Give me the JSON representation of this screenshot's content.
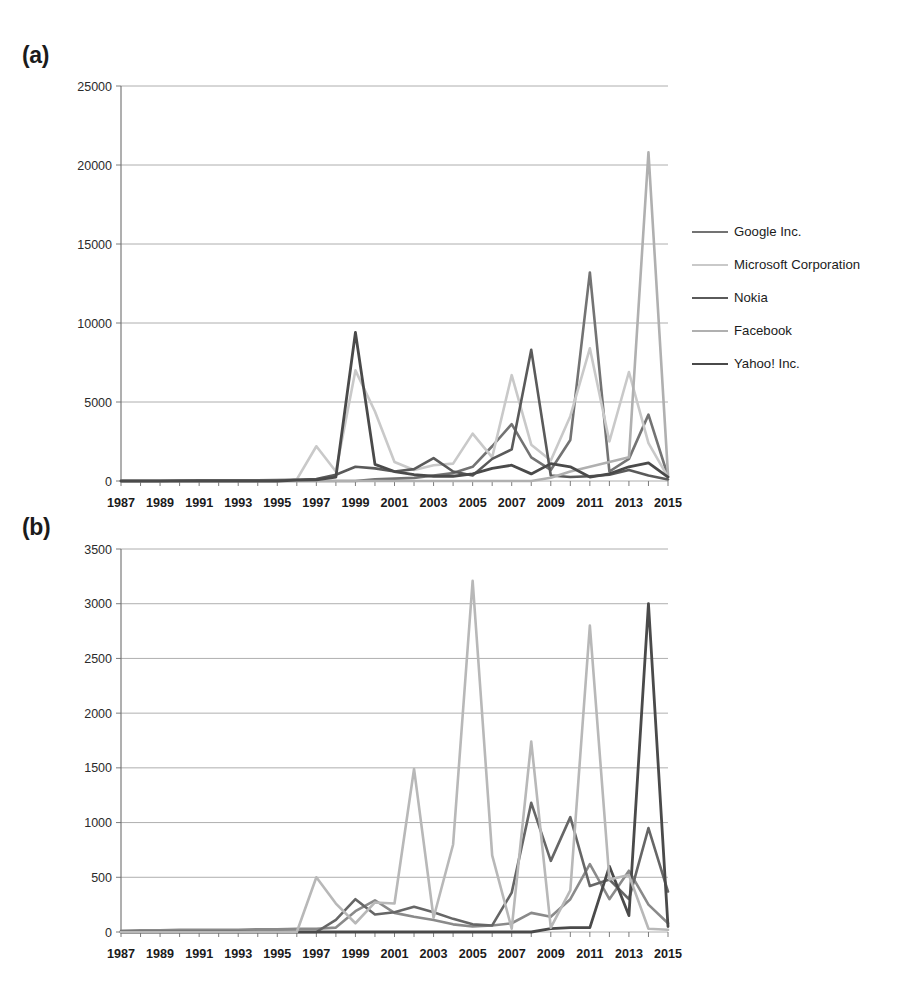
{
  "figure": {
    "panels": [
      {
        "id": "a",
        "label": "(a)"
      },
      {
        "id": "b",
        "label": "(b)"
      }
    ]
  },
  "chart_data": [
    {
      "type": "line",
      "panel_label": "(a)",
      "title": "",
      "xlabel": "",
      "ylabel": "",
      "grid": true,
      "legend_position": "right",
      "xlim": [
        1987,
        2015
      ],
      "ylim": [
        0,
        25000
      ],
      "ytick_values": [
        0,
        5000,
        10000,
        15000,
        20000,
        25000
      ],
      "ytick_labels": [
        "0",
        "5000",
        "10000",
        "15000",
        "20000",
        "25000"
      ],
      "x": [
        1987,
        1988,
        1989,
        1990,
        1991,
        1992,
        1993,
        1994,
        1995,
        1996,
        1997,
        1998,
        1999,
        2000,
        2001,
        2002,
        2003,
        2004,
        2005,
        2006,
        2007,
        2008,
        2009,
        2010,
        2011,
        2012,
        2013,
        2014,
        2015
      ],
      "xtick_labels": [
        "1987",
        "1989",
        "1991",
        "1993",
        "1995",
        "1997",
        "1999",
        "2001",
        "2003",
        "2005",
        "2007",
        "2009",
        "2011",
        "2013",
        "2015"
      ],
      "series": [
        {
          "name": "Google Inc.",
          "color": "#737373",
          "width": 2.6,
          "values": [
            0,
            0,
            0,
            0,
            0,
            0,
            0,
            0,
            0,
            0,
            0,
            0,
            0,
            100,
            150,
            200,
            350,
            500,
            900,
            2200,
            3600,
            1500,
            700,
            2600,
            13200,
            600,
            1400,
            4200,
            300
          ]
        },
        {
          "name": "Microsoft Corporation",
          "color": "#c9c9c9",
          "width": 2.6,
          "values": [
            0,
            0,
            0,
            0,
            0,
            0,
            0,
            0,
            0,
            100,
            2200,
            600,
            7000,
            4400,
            1200,
            700,
            1000,
            1100,
            3000,
            1500,
            6700,
            2300,
            1300,
            4100,
            8400,
            2500,
            6900,
            2400,
            250
          ]
        },
        {
          "name": "Nokia",
          "color": "#5a5a5a",
          "width": 2.6,
          "values": [
            0,
            0,
            0,
            30,
            40,
            40,
            40,
            50,
            60,
            80,
            120,
            400,
            900,
            800,
            600,
            750,
            1450,
            600,
            350,
            1400,
            2000,
            8300,
            350,
            250,
            300,
            400,
            700,
            350,
            100
          ]
        },
        {
          "name": "Facebook",
          "color": "#b0b0b0",
          "width": 2.6,
          "values": [
            0,
            0,
            0,
            0,
            0,
            0,
            0,
            0,
            0,
            0,
            0,
            0,
            0,
            0,
            0,
            0,
            0,
            0,
            0,
            0,
            0,
            0,
            200,
            600,
            900,
            1200,
            1500,
            20800,
            400
          ]
        },
        {
          "name": "Yahoo! Inc.",
          "color": "#4a4a4a",
          "width": 2.8,
          "values": [
            0,
            0,
            0,
            0,
            0,
            0,
            0,
            0,
            0,
            60,
            80,
            250,
            9400,
            1050,
            600,
            400,
            300,
            300,
            450,
            800,
            1000,
            450,
            1100,
            900,
            250,
            450,
            900,
            1150,
            250
          ]
        }
      ]
    },
    {
      "type": "line",
      "panel_label": "(b)",
      "title": "",
      "xlabel": "",
      "ylabel": "",
      "grid": true,
      "legend_position": "right",
      "xlim": [
        1987,
        2015
      ],
      "ylim": [
        0,
        3500
      ],
      "ytick_values": [
        0,
        500,
        1000,
        1500,
        2000,
        2500,
        3000,
        3500
      ],
      "ytick_labels": [
        "0",
        "500",
        "1000",
        "1500",
        "2000",
        "2500",
        "3000",
        "3500"
      ],
      "x": [
        1987,
        1988,
        1989,
        1990,
        1991,
        1992,
        1993,
        1994,
        1995,
        1996,
        1997,
        1998,
        1999,
        2000,
        2001,
        2002,
        2003,
        2004,
        2005,
        2006,
        2007,
        2008,
        2009,
        2010,
        2011,
        2012,
        2013,
        2014,
        2015
      ],
      "xtick_labels": [
        "1987",
        "1989",
        "1991",
        "1993",
        "1995",
        "1997",
        "1999",
        "2001",
        "2003",
        "2005",
        "2007",
        "2009",
        "2011",
        "2013",
        "2015"
      ],
      "series": [
        {
          "name": "Apple Computer Inc.",
          "color": "#8a8a8a",
          "width": 2.6,
          "values": [
            10,
            15,
            15,
            20,
            20,
            20,
            20,
            25,
            25,
            30,
            30,
            40,
            190,
            290,
            175,
            140,
            110,
            70,
            50,
            60,
            80,
            175,
            140,
            300,
            620,
            300,
            560,
            250,
            80
          ]
        },
        {
          "name": "Amazon.com Inc.",
          "color": "#666666",
          "width": 2.6,
          "values": [
            0,
            0,
            0,
            0,
            0,
            0,
            0,
            0,
            0,
            0,
            0,
            110,
            300,
            160,
            180,
            230,
            180,
            120,
            70,
            60,
            360,
            1180,
            650,
            1050,
            420,
            480,
            300,
            950,
            370
          ]
        },
        {
          "name": "Twitter",
          "color": "#4a4a4a",
          "width": 2.8,
          "values": [
            0,
            0,
            0,
            0,
            0,
            0,
            0,
            0,
            0,
            0,
            0,
            0,
            0,
            0,
            0,
            0,
            0,
            0,
            0,
            0,
            0,
            0,
            30,
            40,
            40,
            600,
            150,
            3000,
            50
          ]
        },
        {
          "name": "eBay Inc.",
          "color": "#b8b8b8",
          "width": 2.6,
          "values": [
            0,
            0,
            0,
            0,
            0,
            0,
            0,
            0,
            0,
            0,
            500,
            260,
            80,
            270,
            260,
            1490,
            130,
            800,
            3210,
            700,
            30,
            1740,
            40,
            380,
            2800,
            480,
            520,
            30,
            20
          ]
        }
      ]
    }
  ]
}
